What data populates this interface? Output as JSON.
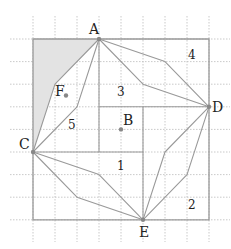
{
  "figure": {
    "grid": {
      "origin_px": [
        33,
        39
      ],
      "cell_px": [
        22,
        22.6
      ],
      "cols": 8,
      "rows": 8,
      "extent_px": {
        "x_min": 10,
        "x_max": 230,
        "y_min": 16,
        "y_max": 242
      },
      "color": "#bbbbbb"
    },
    "colors": {
      "line": "#999999",
      "shade": "#e3e3e3",
      "point": "#888888",
      "text": "#222222"
    },
    "outer_square": [
      [
        0,
        0
      ],
      [
        8,
        0
      ],
      [
        8,
        8
      ],
      [
        0,
        8
      ]
    ],
    "inner_square": [
      [
        3,
        3
      ],
      [
        5,
        3
      ],
      [
        5,
        5
      ],
      [
        3,
        5
      ]
    ],
    "spokes": [
      {
        "from": [
          3,
          0
        ],
        "to": [
          3,
          3
        ]
      },
      {
        "from": [
          8,
          3
        ],
        "to": [
          5,
          3
        ]
      },
      {
        "from": [
          5,
          8
        ],
        "to": [
          5,
          5
        ]
      },
      {
        "from": [
          0,
          5
        ],
        "to": [
          3,
          5
        ]
      }
    ],
    "shaded_region": [
      [
        0,
        0
      ],
      [
        3,
        0
      ],
      [
        1,
        2
      ],
      [
        0,
        5
      ]
    ],
    "zigzags": [
      [
        [
          3,
          0
        ],
        [
          1,
          2
        ],
        [
          0,
          5
        ]
      ],
      [
        [
          3,
          0
        ],
        [
          2,
          3
        ],
        [
          0,
          5
        ]
      ],
      [
        [
          3,
          0
        ],
        [
          6,
          1
        ],
        [
          8,
          3
        ]
      ],
      [
        [
          3,
          0
        ],
        [
          5,
          2
        ],
        [
          8,
          3
        ]
      ],
      [
        [
          8,
          3
        ],
        [
          6,
          5
        ],
        [
          5,
          8
        ]
      ],
      [
        [
          8,
          3
        ],
        [
          7,
          6
        ],
        [
          5,
          8
        ]
      ],
      [
        [
          0,
          5
        ],
        [
          3,
          6
        ],
        [
          5,
          8
        ]
      ],
      [
        [
          0,
          5
        ],
        [
          2,
          7
        ],
        [
          5,
          8
        ]
      ]
    ],
    "points": [
      {
        "name": "A",
        "at": [
          3,
          0
        ],
        "label_offset": [
          -10,
          -5
        ]
      },
      {
        "name": "D",
        "at": [
          8,
          3
        ],
        "label_offset": [
          3,
          5
        ]
      },
      {
        "name": "E",
        "at": [
          5,
          8
        ],
        "label_offset": [
          -4,
          17
        ]
      },
      {
        "name": "C",
        "at": [
          0,
          5
        ],
        "label_offset": [
          -14,
          -3
        ]
      },
      {
        "name": "B",
        "at": [
          4,
          4
        ],
        "label_offset": [
          2,
          -4
        ]
      },
      {
        "name": "F",
        "at": [
          1.5,
          2.5
        ],
        "label_offset": [
          -11,
          0
        ]
      }
    ],
    "region_numbers": [
      {
        "label": "1",
        "px": [
          117,
          170
        ]
      },
      {
        "label": "2",
        "px": [
          188,
          209
        ]
      },
      {
        "label": "3",
        "px": [
          117,
          96
        ]
      },
      {
        "label": "4",
        "px": [
          188,
          59
        ]
      },
      {
        "label": "5",
        "px": [
          68,
          129
        ]
      }
    ]
  }
}
